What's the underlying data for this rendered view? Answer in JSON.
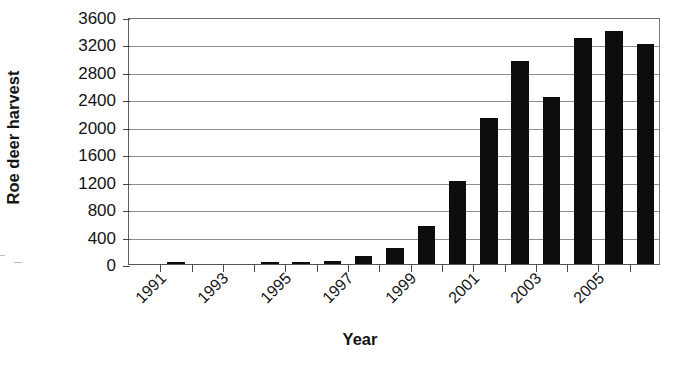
{
  "chart_data": {
    "type": "bar",
    "title": "",
    "xlabel": "Year",
    "ylabel": "Roe deer harvest",
    "categories": [
      "1991",
      "1992",
      "1993",
      "1994",
      "1995",
      "1996",
      "1997",
      "1998",
      "1999",
      "2000",
      "2001",
      "2002",
      "2003",
      "2004",
      "2005",
      "2006",
      "2007"
    ],
    "values": [
      0,
      20,
      0,
      0,
      20,
      25,
      50,
      120,
      240,
      560,
      1210,
      2130,
      2960,
      2430,
      3300,
      3400,
      3200
    ],
    "ylim": [
      0,
      3600
    ],
    "ytick_labels": [
      "0",
      "400",
      "800",
      "1200",
      "1600",
      "2000",
      "2400",
      "2800",
      "3200",
      "3600"
    ],
    "ytick_values": [
      0,
      400,
      800,
      1200,
      1600,
      2000,
      2400,
      2800,
      3200,
      3600
    ],
    "xtick_labels_shown": [
      "1991",
      "1993",
      "1995",
      "1997",
      "1999",
      "2001",
      "2003",
      "2005"
    ],
    "grid": true,
    "legend": "none",
    "bar_color": "#0d0d0d",
    "grid_color": "#8c8c8c",
    "axis_color": "#4a4a4a"
  }
}
